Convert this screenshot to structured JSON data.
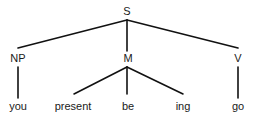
{
  "diagram": {
    "type": "syntax-tree",
    "nodes": {
      "root": {
        "label": "S",
        "x": 127,
        "y": 15
      },
      "np": {
        "label": "NP",
        "x": 18,
        "y": 62
      },
      "m": {
        "label": "M",
        "x": 128,
        "y": 62
      },
      "v": {
        "label": "V",
        "x": 238,
        "y": 62
      },
      "you": {
        "label": "you",
        "x": 18,
        "y": 110
      },
      "present": {
        "label": "present",
        "x": 73,
        "y": 110
      },
      "be": {
        "label": "be",
        "x": 128,
        "y": 110
      },
      "ing": {
        "label": "ing",
        "x": 183,
        "y": 110
      },
      "go": {
        "label": "go",
        "x": 238,
        "y": 110
      }
    },
    "edges": [
      {
        "from": "S",
        "to": "NP"
      },
      {
        "from": "S",
        "to": "M"
      },
      {
        "from": "S",
        "to": "V"
      },
      {
        "from": "NP",
        "to": "you"
      },
      {
        "from": "M",
        "to": "present"
      },
      {
        "from": "M",
        "to": "be"
      },
      {
        "from": "M",
        "to": "ing"
      },
      {
        "from": "V",
        "to": "go"
      }
    ]
  }
}
